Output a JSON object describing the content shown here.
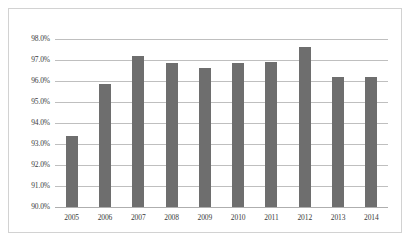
{
  "chart_data": {
    "type": "bar",
    "title": "",
    "subtitle": "",
    "xlabel": "",
    "ylabel": "",
    "categories": [
      "2005",
      "2006",
      "2007",
      "2008",
      "2009",
      "2010",
      "2011",
      "2012",
      "2013",
      "2014"
    ],
    "values": [
      93.4,
      95.85,
      97.2,
      96.85,
      96.6,
      96.85,
      96.9,
      97.6,
      96.2,
      96.2
    ],
    "ylim": [
      90.0,
      98.0
    ],
    "ytick_labels": [
      "98.0%",
      "97.0%",
      "96.0%",
      "95.0%",
      "94.0%",
      "93.0%",
      "92.0%",
      "91.0%",
      "90.0%"
    ],
    "ytick_values": [
      98.0,
      97.0,
      96.0,
      95.0,
      94.0,
      93.0,
      92.0,
      91.0,
      90.0
    ],
    "grid": true,
    "legend": false,
    "legend_position": "none",
    "series": [
      {
        "name": "",
        "color": "#6e6e6e",
        "values": [
          93.4,
          95.85,
          97.2,
          96.85,
          96.6,
          96.85,
          96.9,
          97.6,
          96.2,
          96.2
        ]
      }
    ]
  },
  "colors": {
    "bar": "#6e6e6e",
    "gridline": "#bfbfbf",
    "axis": "#aeaeae",
    "frame": "#d2d2d2",
    "text": "#3a3a3a",
    "background": "#ffffff"
  }
}
